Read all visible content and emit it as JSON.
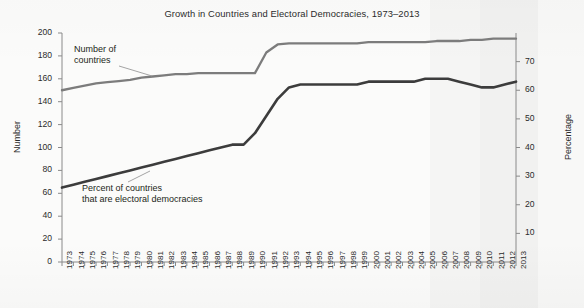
{
  "chart_data": {
    "type": "line",
    "title": "Growth in Countries and Electoral Democracies, 1973–2013",
    "xlabel": "",
    "ylabel": "Number",
    "ylabel_secondary": "Percentage",
    "grid": false,
    "legend_position": "inline-annotations",
    "x": [
      1973,
      1974,
      1975,
      1976,
      1977,
      1978,
      1979,
      1980,
      1981,
      1982,
      1983,
      1984,
      1985,
      1986,
      1987,
      1988,
      1989,
      1990,
      1991,
      1992,
      1993,
      1994,
      1995,
      1996,
      1997,
      1998,
      1999,
      2000,
      2001,
      2002,
      2003,
      2004,
      2005,
      2006,
      2007,
      2008,
      2009,
      2010,
      2011,
      2012,
      2013
    ],
    "xtick_labels": [
      "1973",
      "1974",
      "1975",
      "1976",
      "1977",
      "1978",
      "1979",
      "1980",
      "1981",
      "1982",
      "1983",
      "1984",
      "1985",
      "1986",
      "1987",
      "1988",
      "1989",
      "1990",
      "1991",
      "1992",
      "1993",
      "1994",
      "1995",
      "1996",
      "1997",
      "1998",
      "1999",
      "2000",
      "2001",
      "2002",
      "2003",
      "2004",
      "2005",
      "2006",
      "2007",
      "2008",
      "2009",
      "2010",
      "2011",
      "2012",
      "2013"
    ],
    "ylim": [
      0,
      200
    ],
    "yticks": [
      0,
      20,
      40,
      60,
      80,
      100,
      120,
      140,
      160,
      180,
      200
    ],
    "ytick_labels": [
      "0",
      "20",
      "40",
      "60",
      "80",
      "100",
      "120",
      "140",
      "160",
      "180",
      "200"
    ],
    "ylim_secondary": [
      0,
      80
    ],
    "yticks_secondary": [
      10,
      20,
      30,
      40,
      50,
      60,
      70
    ],
    "ytick_labels_secondary": [
      "10",
      "20",
      "30",
      "40",
      "50",
      "60",
      "70"
    ],
    "series": [
      {
        "name": "Number of countries",
        "annotation": "Number of\ncountries",
        "annotation_line1": "Number of",
        "annotation_line2": "countries",
        "axis": "left",
        "units": "countries",
        "color": "#7c7c7c",
        "values": [
          150,
          152,
          154,
          156,
          157,
          158,
          159,
          161,
          162,
          163,
          164,
          164,
          165,
          165,
          165,
          165,
          165,
          165,
          183,
          190,
          191,
          191,
          191,
          191,
          191,
          191,
          191,
          192,
          192,
          192,
          192,
          192,
          192,
          193,
          193,
          193,
          194,
          194,
          195,
          195,
          195
        ]
      },
      {
        "name": "Percent of countries that are electoral democracies",
        "annotation": "Percent of countries\nthat are electoral democracies",
        "annotation_line1": "Percent of countries",
        "annotation_line2": "that are electoral democracies",
        "axis": "right",
        "units": "percent",
        "color": "#3c3c3c",
        "values": [
          26,
          27,
          28,
          29,
          30,
          31,
          32,
          33,
          34,
          35,
          36,
          37,
          38,
          39,
          40,
          41,
          41,
          45,
          51,
          57,
          61,
          62,
          62,
          62,
          62,
          62,
          62,
          63,
          63,
          63,
          63,
          63,
          64,
          64,
          64,
          63,
          62,
          61,
          61,
          62,
          63
        ]
      }
    ]
  }
}
